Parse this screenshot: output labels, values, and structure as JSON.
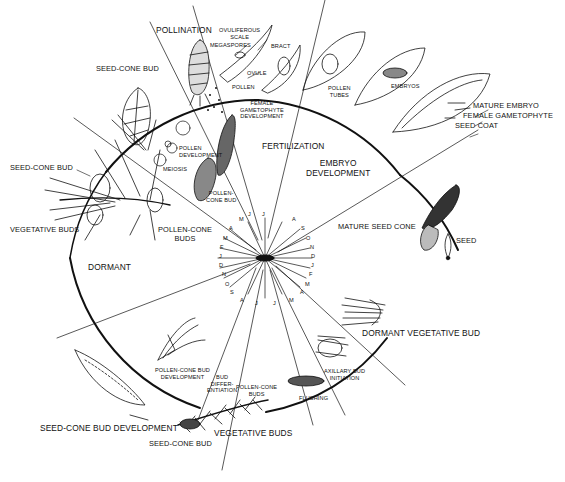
{
  "colors": {
    "ink": "#111111",
    "background": "#ffffff"
  },
  "phases": {
    "pollination": "POLLINATION",
    "female_gametophyte": "FEMALE\nGAMETOPHYTE\nDEVELOPMENT",
    "fertilization": "FERTILIZATION",
    "embryo_development": "EMBRYO\nDEVELOPMENT",
    "pollen_development": "POLLEN\nDEVELOPMENT",
    "meiosis": "MEIOSIS",
    "dormant": "DORMANT",
    "flushing": "FLUSHING",
    "axillary_bud_initiation": "AXILLARY BUD\nINITIATION",
    "bud_differentiation": "BUD\nDIFFER-\nENTIATION",
    "pollen_cone_bud_development": "POLLEN-CONE BUD\nDEVELOPMENT",
    "seed_cone_bud_development": "SEED-CONE BUD DEVELOPMENT"
  },
  "structures": {
    "seed_cone_bud_top": "SEED-CONE BUD",
    "seed_cone_bud_left": "SEED-CONE BUD",
    "vegetative_buds_left": "VEGETATIVE BUDS",
    "pollen_cone_buds_left": "POLLEN-CONE\nBUDS",
    "ovuliferous_scale": "OVULIFEROUS\nSCALE",
    "megaspores": "MEGASPORES",
    "bract": "BRACT",
    "ovule": "OVULE",
    "pollen": "POLLEN",
    "pollen_cone_bud": "POLLEN-\nCONE BUD",
    "pollen_tubes": "POLLEN\nTUBES",
    "embryos": "EMBRYOS",
    "mature_embryo": "MATURE EMBRYO",
    "female_gametophyte": "FEMALE GAMETOPHYTE",
    "seed_coat": "SEED COAT",
    "mature_seed_cone": "MATURE SEED CONE",
    "seed": "SEED",
    "dormant_vegetative_bud": "DORMANT VEGETATIVE BUD",
    "pollen_cone_buds_bottom": "POLLEN-CONE\nBUDS",
    "vegetative_buds_bottom": "VEGETATIVE BUDS",
    "seed_cone_bud_bottom": "SEED-CONE BUD"
  },
  "months_right": [
    "J",
    "A",
    "S",
    "O",
    "N",
    "D",
    "J",
    "F",
    "M",
    "A",
    "M",
    "J"
  ],
  "months_left": [
    "J",
    "M",
    "A",
    "M",
    "F",
    "J",
    "D",
    "N",
    "O",
    "S",
    "A",
    "J"
  ]
}
